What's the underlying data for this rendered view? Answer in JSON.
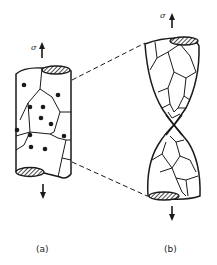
{
  "figure": {
    "panel_a": {
      "label": "(a)",
      "stress_symbol": "σ",
      "description": "Cylindrical specimen with grains and cavities (dots) before deformation"
    },
    "panel_b": {
      "label": "(b)",
      "stress_symbol": "σ",
      "description": "Specimen necked down to a point (rupture) with elongated grains"
    }
  },
  "colors": {
    "ink": "#1a1a1a",
    "background": "#ffffff"
  }
}
